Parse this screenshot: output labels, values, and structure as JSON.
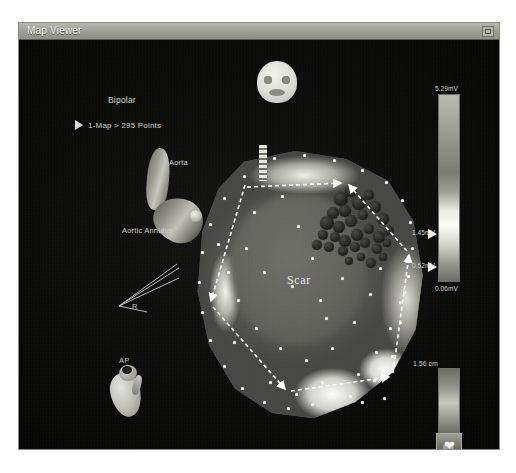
{
  "window": {
    "title": "Map Viewer",
    "restore_button": "restore-window"
  },
  "overlays": {
    "map_type": "Bipolar",
    "map_points": "1-Map > 295 Points",
    "aorta": "Aorta",
    "aortic_annulus": "Aortic Annulus",
    "orientation_right": "R",
    "orientation_ap": "AP",
    "region_label": "Scar"
  },
  "voltage_scale": {
    "max": "5.29mV",
    "upper_threshold": "1.45mV",
    "lower_threshold": "0.52mV",
    "min": "0.06mV"
  },
  "depth_scale": {
    "value": "1.56 cm"
  },
  "controls": {
    "heart_button_icon": "heart-icon",
    "play_icon": "play-triangle-icon",
    "face_icon": "head-orientation-icon",
    "heart_model_icon": "heart-model-icon"
  },
  "colors": {
    "window_bg": "#20201e",
    "title_bar": "#a3a39e",
    "canvas_bg": "#0b0b0a",
    "overlay_text": "#c9c9c4",
    "point_marker": "#f4f4f0",
    "lesion": "#222220"
  },
  "lesions": [
    {
      "x": 148,
      "y": 48,
      "r": 7
    },
    {
      "x": 158,
      "y": 40,
      "r": 6
    },
    {
      "x": 166,
      "y": 52,
      "r": 7
    },
    {
      "x": 152,
      "y": 60,
      "r": 6
    },
    {
      "x": 140,
      "y": 62,
      "r": 6
    },
    {
      "x": 134,
      "y": 72,
      "r": 7
    },
    {
      "x": 146,
      "y": 76,
      "r": 6
    },
    {
      "x": 158,
      "y": 70,
      "r": 6
    },
    {
      "x": 170,
      "y": 64,
      "r": 5
    },
    {
      "x": 176,
      "y": 44,
      "r": 5
    },
    {
      "x": 182,
      "y": 56,
      "r": 6
    },
    {
      "x": 190,
      "y": 68,
      "r": 6
    },
    {
      "x": 196,
      "y": 80,
      "r": 5
    },
    {
      "x": 186,
      "y": 86,
      "r": 6
    },
    {
      "x": 176,
      "y": 78,
      "r": 5
    },
    {
      "x": 164,
      "y": 84,
      "r": 6
    },
    {
      "x": 152,
      "y": 90,
      "r": 6
    },
    {
      "x": 142,
      "y": 86,
      "r": 5
    },
    {
      "x": 130,
      "y": 84,
      "r": 5
    },
    {
      "x": 124,
      "y": 94,
      "r": 5
    },
    {
      "x": 136,
      "y": 96,
      "r": 5
    },
    {
      "x": 150,
      "y": 100,
      "r": 5
    },
    {
      "x": 162,
      "y": 96,
      "r": 5
    },
    {
      "x": 172,
      "y": 92,
      "r": 5
    },
    {
      "x": 184,
      "y": 98,
      "r": 5
    },
    {
      "x": 194,
      "y": 92,
      "r": 4
    },
    {
      "x": 168,
      "y": 106,
      "r": 4
    },
    {
      "x": 156,
      "y": 110,
      "r": 4
    },
    {
      "x": 178,
      "y": 112,
      "r": 5
    },
    {
      "x": 190,
      "y": 106,
      "r": 4
    }
  ],
  "points": [
    {
      "x": 80,
      "y": 6
    },
    {
      "x": 110,
      "y": 3
    },
    {
      "x": 140,
      "y": 8
    },
    {
      "x": 168,
      "y": 18
    },
    {
      "x": 192,
      "y": 30
    },
    {
      "x": 208,
      "y": 48
    },
    {
      "x": 216,
      "y": 70
    },
    {
      "x": 218,
      "y": 96
    },
    {
      "x": 214,
      "y": 124
    },
    {
      "x": 206,
      "y": 150
    },
    {
      "x": 196,
      "y": 176
    },
    {
      "x": 182,
      "y": 200
    },
    {
      "x": 164,
      "y": 222
    },
    {
      "x": 142,
      "y": 240
    },
    {
      "x": 118,
      "y": 252
    },
    {
      "x": 94,
      "y": 256
    },
    {
      "x": 70,
      "y": 250
    },
    {
      "x": 48,
      "y": 236
    },
    {
      "x": 30,
      "y": 214
    },
    {
      "x": 16,
      "y": 188
    },
    {
      "x": 8,
      "y": 160
    },
    {
      "x": 5,
      "y": 130
    },
    {
      "x": 8,
      "y": 100
    },
    {
      "x": 16,
      "y": 72
    },
    {
      "x": 30,
      "y": 46
    },
    {
      "x": 50,
      "y": 24
    },
    {
      "x": 60,
      "y": 60
    },
    {
      "x": 88,
      "y": 44
    },
    {
      "x": 104,
      "y": 74
    },
    {
      "x": 52,
      "y": 96
    },
    {
      "x": 70,
      "y": 120
    },
    {
      "x": 98,
      "y": 134
    },
    {
      "x": 126,
      "y": 148
    },
    {
      "x": 44,
      "y": 148
    },
    {
      "x": 62,
      "y": 176
    },
    {
      "x": 86,
      "y": 196
    },
    {
      "x": 112,
      "y": 208
    },
    {
      "x": 138,
      "y": 196
    },
    {
      "x": 160,
      "y": 170
    },
    {
      "x": 176,
      "y": 142
    },
    {
      "x": 186,
      "y": 116
    },
    {
      "x": 148,
      "y": 126
    },
    {
      "x": 118,
      "y": 106
    },
    {
      "x": 132,
      "y": 166
    },
    {
      "x": 156,
      "y": 244
    },
    {
      "x": 180,
      "y": 228
    },
    {
      "x": 198,
      "y": 204
    },
    {
      "x": 34,
      "y": 120
    },
    {
      "x": 24,
      "y": 92
    },
    {
      "x": 40,
      "y": 190
    },
    {
      "x": 76,
      "y": 230
    },
    {
      "x": 102,
      "y": 242
    },
    {
      "x": 128,
      "y": 230
    },
    {
      "x": 206,
      "y": 170
    },
    {
      "x": 210,
      "y": 140
    },
    {
      "x": 168,
      "y": 250
    },
    {
      "x": 190,
      "y": 246
    }
  ]
}
